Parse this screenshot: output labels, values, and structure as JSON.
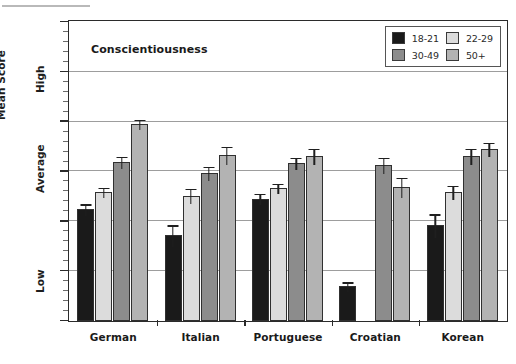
{
  "chart_data": {
    "type": "bar",
    "title": "Conscientiousness",
    "xlabel": "",
    "ylabel": "Mean Score",
    "ylim": [
      35,
      65
    ],
    "ytick_values": [
      35,
      40,
      45,
      50,
      55,
      60,
      65
    ],
    "ytick_labels": [
      "35",
      "40",
      "45",
      "50",
      "55",
      "60",
      "65"
    ],
    "y_annotations": [
      {
        "label": "High",
        "value": 60
      },
      {
        "label": "Average",
        "value": 50
      },
      {
        "label": "Low",
        "value": 40
      }
    ],
    "grid": true,
    "grid_axis": "y",
    "legend_position": "top-right",
    "categories": [
      "German",
      "Italian",
      "Portuguese",
      "Croatian",
      "Korean"
    ],
    "series": [
      {
        "name": "18-21",
        "color": "#1a1a1a",
        "values": [
          46.2,
          43.6,
          47.3,
          38.5,
          44.6
        ],
        "errors": [
          0.6,
          1.1,
          0.6,
          0.5,
          1.2
        ]
      },
      {
        "name": "22-29",
        "color": "#dcdcdc",
        "values": [
          48.0,
          47.6,
          48.4,
          null,
          48.0
        ],
        "errors": [
          0.5,
          0.8,
          0.5,
          null,
          0.7
        ]
      },
      {
        "name": "30-49",
        "color": "#8c8c8c",
        "values": [
          51.0,
          49.9,
          50.9,
          50.7,
          51.6
        ],
        "errors": [
          0.6,
          0.7,
          0.6,
          0.8,
          0.8
        ]
      },
      {
        "name": "50+",
        "color": "#b3b3b3",
        "values": [
          54.8,
          51.7,
          51.6,
          48.5,
          52.3
        ],
        "errors": [
          0.5,
          0.9,
          0.8,
          1.0,
          0.7
        ]
      }
    ]
  },
  "legend": {
    "entries": [
      {
        "label": "18-21",
        "color": "#1a1a1a"
      },
      {
        "label": "22-29",
        "color": "#dcdcdc"
      },
      {
        "label": "30-49",
        "color": "#8c8c8c"
      },
      {
        "label": "50+",
        "color": "#b3b3b3"
      }
    ]
  }
}
